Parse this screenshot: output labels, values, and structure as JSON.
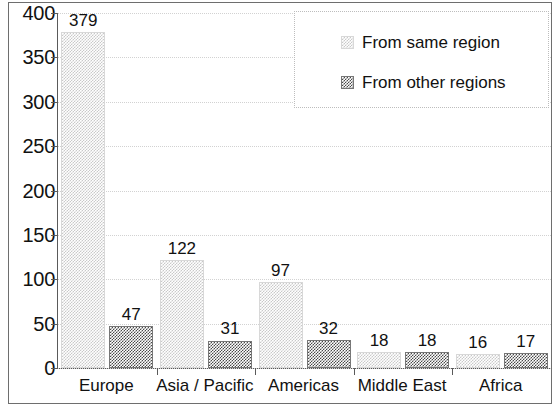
{
  "chart_data": {
    "type": "bar",
    "title": "",
    "xlabel": "",
    "ylabel": "",
    "ylim": [
      0,
      400
    ],
    "ytick_step": 50,
    "yticks": [
      400,
      350,
      300,
      250,
      200,
      150,
      100,
      50,
      0
    ],
    "grid": true,
    "grid_style": "dotted-horizontal",
    "legend_position": "top-right",
    "categories": [
      "Europe",
      "Asia / Pacific",
      "Americas",
      "Middle East",
      "Africa"
    ],
    "series": [
      {
        "name": "From same region",
        "swatch": "light-dotted",
        "values": [
          379,
          122,
          97,
          18,
          16
        ]
      },
      {
        "name": "From other regions",
        "swatch": "dark-checker",
        "values": [
          47,
          31,
          32,
          18,
          17
        ]
      }
    ],
    "data_labels": [
      [
        "379",
        "122",
        "97",
        "18",
        "16"
      ],
      [
        "47",
        "31",
        "32",
        "18",
        "17"
      ]
    ]
  },
  "legend": {
    "entries": [
      {
        "label": "From same region"
      },
      {
        "label": "From other regions"
      }
    ]
  },
  "colors": {
    "frame": "#6e6e6e",
    "axis": "#5a5a5a",
    "gridline": "#d2d2d2",
    "text": "#111111",
    "series_same": "#c9c9c9",
    "series_other": "#4a4a4a",
    "background": "#ffffff"
  }
}
